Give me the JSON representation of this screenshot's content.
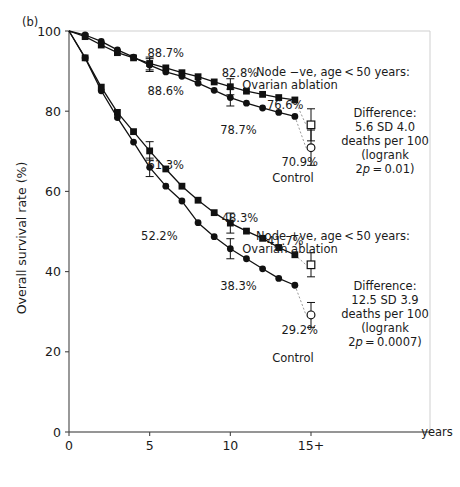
{
  "panel": {
    "label": "(b)"
  },
  "axes": {
    "y_title": "Overall survival rate (%)",
    "y_ticks": [
      "0",
      "20",
      "40",
      "60",
      "80",
      "100"
    ],
    "x_ticks": [
      "0",
      "5",
      "10",
      "15+"
    ],
    "x_units": "years"
  },
  "chart_data": {
    "type": "line",
    "xlabel": "years",
    "ylabel": "Overall survival rate (%)",
    "xlim": [
      0,
      15
    ],
    "ylim": [
      0,
      100
    ],
    "grid": false,
    "legend": "annotations",
    "x": [
      0,
      1,
      2,
      3,
      4,
      5,
      6,
      7,
      8,
      9,
      10,
      11,
      12,
      13,
      14,
      15
    ],
    "series": [
      {
        "name": "Node -ve, age <50 years: Ovarian ablation",
        "marker": "filled-square",
        "values": [
          100,
          98.6,
          96.5,
          94.6,
          93.3,
          91.9,
          90.8,
          89.6,
          88.6,
          87.3,
          86.1,
          85.0,
          84.2,
          83.4,
          82.8,
          76.6
        ],
        "error_bars": [
          {
            "x": 5,
            "value": 91.9,
            "sd": 1.6
          },
          {
            "x": 10,
            "value": 86.1,
            "sd": 2.0
          }
        ],
        "endpoint": {
          "x": 15,
          "value": 76.6,
          "marker": "open-square",
          "sd": 4.0
        }
      },
      {
        "name": "Node -ve, age <50 years: Control",
        "marker": "filled-circle",
        "values": [
          100,
          99.0,
          97.4,
          95.3,
          93.5,
          91.5,
          89.8,
          88.7,
          87.0,
          85.2,
          83.4,
          82.0,
          80.8,
          79.7,
          78.7,
          70.9
        ],
        "error_bars": [
          {
            "x": 5,
            "value": 91.5,
            "sd": 1.6
          },
          {
            "x": 10,
            "value": 83.4,
            "sd": 2.1
          }
        ],
        "endpoint": {
          "x": 15,
          "value": 70.9,
          "marker": "open-circle",
          "sd": 4.4
        }
      },
      {
        "name": "Node +ve, age <50 years: Ovarian ablation",
        "marker": "filled-square",
        "values": [
          100,
          93.3,
          86.0,
          79.7,
          74.9,
          70.1,
          65.6,
          61.3,
          57.8,
          54.7,
          52.1,
          50.1,
          48.3,
          46.0,
          44.2,
          41.7
        ],
        "error_bars": [
          {
            "x": 5,
            "value": 70.1,
            "sd": 2.3
          },
          {
            "x": 10,
            "value": 52.1,
            "sd": 2.5
          }
        ],
        "endpoint": {
          "x": 15,
          "value": 41.7,
          "marker": "open-square",
          "sd": 3.0
        }
      },
      {
        "name": "Node +ve, age <50 years: Control",
        "marker": "filled-circle",
        "values": [
          100,
          93.3,
          85.1,
          78.4,
          72.3,
          66.0,
          61.3,
          57.6,
          52.2,
          48.7,
          45.7,
          43.2,
          40.7,
          38.3,
          36.6,
          29.2
        ],
        "error_bars": [
          {
            "x": 5,
            "value": 66.0,
            "sd": 2.3
          },
          {
            "x": 10,
            "value": 45.7,
            "sd": 2.5
          }
        ],
        "endpoint": {
          "x": 15,
          "value": 29.2,
          "marker": "open-circle",
          "sd": 3.1
        }
      }
    ],
    "point_labels": [
      {
        "name": "node-neg-control-year7",
        "text": "88.7%",
        "x": 6.0,
        "y": 93.5
      },
      {
        "name": "node-neg-ablation-year8",
        "text": "88.6%",
        "x": 6.0,
        "y": 84.0
      },
      {
        "name": "node-neg-ablation-y14",
        "text": "82.8%",
        "x": 10.6,
        "y": 88.5
      },
      {
        "name": "node-neg-ablation-end",
        "text": "76.6%",
        "x": 13.4,
        "y": 80.5
      },
      {
        "name": "node-neg-control-y14",
        "text": "78.7%",
        "x": 10.5,
        "y": 74.4
      },
      {
        "name": "node-neg-control-end",
        "text": "70.9%",
        "x": 14.3,
        "y": 66.3
      },
      {
        "name": "node-pos-ablation-year7",
        "text": "61.3%",
        "x": 6.0,
        "y": 65.5
      },
      {
        "name": "node-pos-control-year8",
        "text": "52.2%",
        "x": 5.6,
        "y": 48.0
      },
      {
        "name": "node-pos-ablation-y12",
        "text": "48.3%",
        "x": 10.6,
        "y": 52.3
      },
      {
        "name": "node-pos-ablation-end",
        "text": "41.7%",
        "x": 13.4,
        "y": 46.6
      },
      {
        "name": "node-pos-control-y13",
        "text": "38.3%",
        "x": 10.5,
        "y": 35.5
      },
      {
        "name": "node-pos-control-end",
        "text": "29.2%",
        "x": 14.3,
        "y": 24.5
      }
    ],
    "group_annotations": [
      {
        "name": "node-negative-group",
        "lines": [
          "Node −ve, age < 50 years:",
          "Ovarian ablation"
        ],
        "control_label": "Control"
      },
      {
        "name": "node-positive-group",
        "lines": [
          "Node +ve, age < 50 years:",
          "Ovarian ablation"
        ],
        "control_label": "Control"
      }
    ],
    "difference_boxes": [
      {
        "name": "node-negative-difference",
        "heading": "Difference:",
        "value": "5.6 SD 4.0",
        "unit": "deaths per 100",
        "test_open": "(logrank",
        "p_prefix": "2",
        "p_italic": "p",
        "p_value": " = 0.01)"
      },
      {
        "name": "node-positive-difference",
        "heading": "Difference:",
        "value": "12.5 SD 3.9",
        "unit": "deaths per 100",
        "test_open": "(logrank",
        "p_prefix": "2",
        "p_italic": "p",
        "p_value": " = 0.0007)"
      }
    ]
  },
  "colors": {
    "ink": "#1a1a1a",
    "axis": "#333333",
    "frame": "#cccccc",
    "background": "#ffffff"
  }
}
